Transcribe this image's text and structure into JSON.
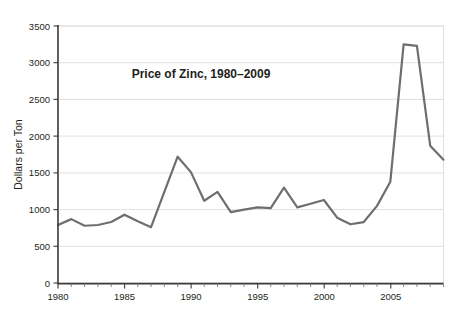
{
  "chart_data": {
    "type": "line",
    "title": "Price of Zinc, 1980–2009",
    "xlabel": "",
    "ylabel": "Dollars per Ton",
    "x": [
      1980,
      1981,
      1982,
      1983,
      1984,
      1985,
      1986,
      1987,
      1988,
      1989,
      1990,
      1991,
      1992,
      1993,
      1994,
      1995,
      1996,
      1997,
      1998,
      1999,
      2000,
      2001,
      2002,
      2003,
      2004,
      2005,
      2006,
      2007,
      2008,
      2009
    ],
    "values": [
      790,
      870,
      780,
      790,
      830,
      930,
      840,
      760,
      1240,
      1720,
      1510,
      1120,
      1240,
      965,
      1000,
      1030,
      1020,
      1300,
      1030,
      1080,
      1130,
      890,
      800,
      830,
      1050,
      1380,
      3250,
      3230,
      1870,
      1680
    ],
    "categories": [
      "1980",
      "1981",
      "1982",
      "1983",
      "1984",
      "1985",
      "1986",
      "1987",
      "1988",
      "1989",
      "1990",
      "1991",
      "1992",
      "1993",
      "1994",
      "1995",
      "1996",
      "1997",
      "1998",
      "1999",
      "2000",
      "2001",
      "2002",
      "2003",
      "2004",
      "2005",
      "2006",
      "2007",
      "2008",
      "2009"
    ],
    "series": [
      {
        "name": "Price of Zinc",
        "values": [
          790,
          870,
          780,
          790,
          830,
          930,
          840,
          760,
          1240,
          1720,
          1510,
          1120,
          1240,
          965,
          1000,
          1030,
          1020,
          1300,
          1030,
          1080,
          1130,
          890,
          800,
          830,
          1050,
          1380,
          3250,
          3230,
          1870,
          1680
        ]
      }
    ],
    "xlim": [
      1980,
      2009
    ],
    "ylim": [
      0,
      3500
    ],
    "y_ticks": [
      0,
      500,
      1000,
      1500,
      2000,
      2500,
      3000,
      3500
    ],
    "y_tick_labels": [
      "0",
      "500",
      "1000",
      "1500",
      "2000",
      "2500",
      "3000",
      "3500"
    ],
    "x_ticks": [
      1980,
      1985,
      1990,
      1995,
      2000,
      2005
    ],
    "x_tick_labels": [
      "1980",
      "1985",
      "1990",
      "1995",
      "2000",
      "2005"
    ],
    "x_minor_tick_interval": 1,
    "grid": true,
    "grid_axis": "y",
    "legend": false,
    "legend_position": "none",
    "line_color": "#6e6e6e",
    "grid_color": "#d9d9d9",
    "axis_color": "#3b3b3b",
    "text_color": "#231f20",
    "background_color": "#ffffff"
  },
  "labels": {
    "title": "Price of Zinc, 1980–2009",
    "y_axis_title": "Dollars per Ton",
    "y_0": "0",
    "y_500": "500",
    "y_1000": "1000",
    "y_1500": "1500",
    "y_2000": "2000",
    "y_2500": "2500",
    "y_3000": "3000",
    "y_3500": "3500",
    "x_1980": "1980",
    "x_1985": "1985",
    "x_1990": "1990",
    "x_1995": "1995",
    "x_2000": "2000",
    "x_2005": "2005"
  }
}
